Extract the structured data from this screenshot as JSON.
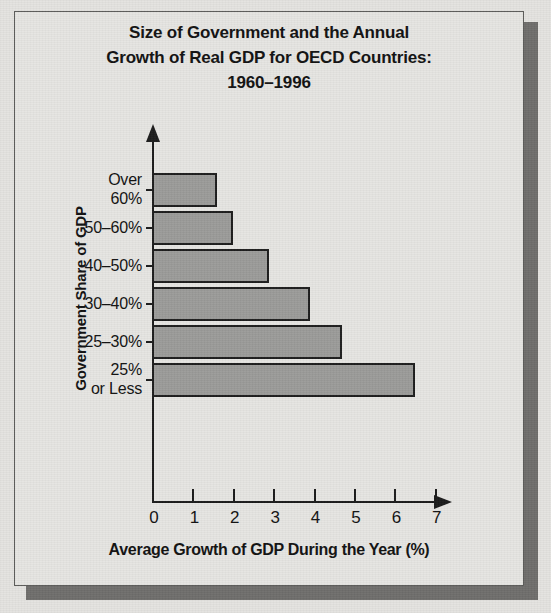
{
  "chart_data": {
    "type": "bar",
    "orientation": "horizontal",
    "title": "Size of Government and the Annual Growth of Real GDP for OECD Countries: 1960–1996",
    "title_lines": [
      "Size of Government and the Annual",
      "Growth of Real GDP for OECD Countries:",
      "1960–1996"
    ],
    "xlabel": "Average Growth of GDP During the Year (%)",
    "ylabel": "Government Share of GDP",
    "categories": [
      "Over 60%",
      "50–60%",
      "40–50%",
      "30–40%",
      "25–30%",
      "25% or Less"
    ],
    "category_lines": [
      [
        "Over",
        "60%"
      ],
      [
        "50–60%"
      ],
      [
        "40–50%"
      ],
      [
        "30–40%"
      ],
      [
        "25–30%"
      ],
      [
        "25%",
        "or Less"
      ]
    ],
    "values": [
      1.6,
      2.0,
      2.9,
      3.9,
      4.7,
      6.5
    ],
    "xlim": [
      0,
      7
    ],
    "xticks": [
      0,
      1,
      2,
      3,
      4,
      5,
      6,
      7
    ],
    "xtick_labels": [
      "0",
      "1",
      "2",
      "3",
      "4",
      "5",
      "6",
      "7"
    ],
    "grid": false,
    "legend": null,
    "colors": {
      "bar_fill": "#9b9b99",
      "bar_border": "#1d1d1d",
      "axis": "#1b1b1b",
      "background": "#e6e5e2",
      "panel_border": "#5a5a58",
      "shadow": "#6f6e6c",
      "text": "#111111"
    }
  }
}
